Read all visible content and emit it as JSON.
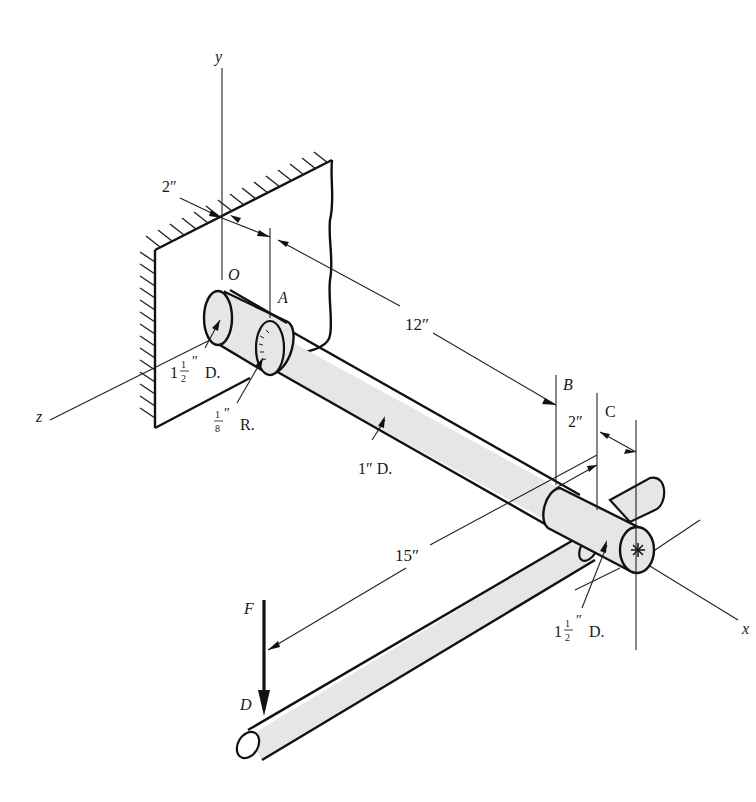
{
  "figure": {
    "type": "isometric shaft assembly drawing",
    "axes": {
      "x": "x",
      "y": "y",
      "z": "z"
    },
    "points": {
      "origin": "O",
      "A": "A",
      "B": "B",
      "C": "C",
      "D": "D"
    },
    "force": {
      "label": "F",
      "direction": "down"
    },
    "dimensions": {
      "wall_to_A": "2″",
      "A_to_B": "12″",
      "B_to_C": "2″",
      "C_to_end": "",
      "arm_length": "15″"
    },
    "callouts": {
      "left_collar_diameter_whole": "1",
      "left_collar_diameter_num": "1",
      "left_collar_diameter_den": "2",
      "left_collar_suffix": "D.",
      "fillet_num": "1",
      "fillet_den": "8",
      "fillet_suffix": "R.",
      "shaft_diameter": "1″ D.",
      "right_collar_diameter_whole": "1",
      "right_collar_diameter_num": "1",
      "right_collar_diameter_den": "2",
      "right_collar_suffix": "D."
    },
    "inch_mark": "″",
    "colors": {
      "line": "#111111",
      "fill": "#e6e6e6",
      "background": "#ffffff"
    }
  }
}
